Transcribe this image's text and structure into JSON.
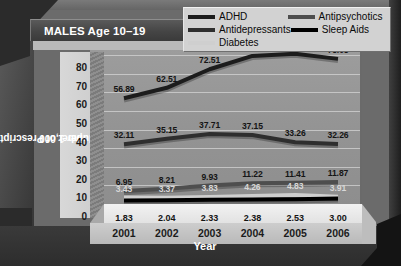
{
  "title": "MALES Age 10–19",
  "legend": {
    "entries": [
      {
        "label": "ADHD",
        "color": "#1c1c1c"
      },
      {
        "label": "Antipsychotics",
        "color": "#4e4e4e"
      },
      {
        "label": "Antidepressants",
        "color": "#2e2e2e"
      },
      {
        "label": "Sleep Aids",
        "color": "#000000"
      },
      {
        "label": "Diabetes",
        "color": "#cfcfcf"
      }
    ]
  },
  "axes": {
    "y_title": "Number of Prescriptions\nper 1,000",
    "y_title_line1": "Number of Prescriptions",
    "y_title_line2": "per 1,000",
    "x_title": "Year",
    "y_ticks": [
      "80",
      "70",
      "60",
      "50",
      "40",
      "30",
      "20",
      "10",
      "0"
    ]
  },
  "chart_data": {
    "type": "line",
    "title": "MALES Age 10–19",
    "xlabel": "Year",
    "ylabel": "Number of Prescriptions per 1,000",
    "categories": [
      "2001",
      "2002",
      "2003",
      "2004",
      "2005",
      "2006"
    ],
    "ylim": [
      0,
      85
    ],
    "grid": true,
    "legend_position": "top-right",
    "series": [
      {
        "name": "ADHD",
        "color": "#1c1c1c",
        "values": [
          56.89,
          62.51,
          72.51,
          79.67,
          80.89,
          78.08
        ],
        "labels": [
          "56.89",
          "62.51",
          "72.51",
          "79.67",
          "80.89",
          "78.08"
        ]
      },
      {
        "name": "Antidepressants",
        "color": "#2e2e2e",
        "values": [
          32.11,
          35.15,
          37.71,
          37.15,
          33.26,
          32.26
        ],
        "labels": [
          "32.11",
          "35.15",
          "37.71",
          "37.15",
          "33.26",
          "32.26"
        ]
      },
      {
        "name": "Antipsychotics",
        "color": "#4e4e4e",
        "values": [
          6.95,
          8.21,
          9.93,
          11.22,
          11.41,
          11.87
        ],
        "labels": [
          "6.95",
          "8.21",
          "9.93",
          "11.22",
          "11.41",
          "11.87"
        ]
      },
      {
        "name": "Diabetes",
        "color": "#cfcfcf",
        "values": [
          3.43,
          3.37,
          3.83,
          4.26,
          4.83,
          3.91
        ],
        "labels": [
          "3.43",
          "3.37",
          "3.83",
          "4.26",
          "4.83",
          "3.91"
        ]
      },
      {
        "name": "Sleep Aids",
        "color": "#000000",
        "values": [
          1.83,
          2.04,
          2.33,
          2.38,
          2.53,
          3.0
        ],
        "labels": [
          "1.83",
          "2.04",
          "2.33",
          "2.38",
          "2.53",
          "3.00"
        ]
      }
    ]
  }
}
